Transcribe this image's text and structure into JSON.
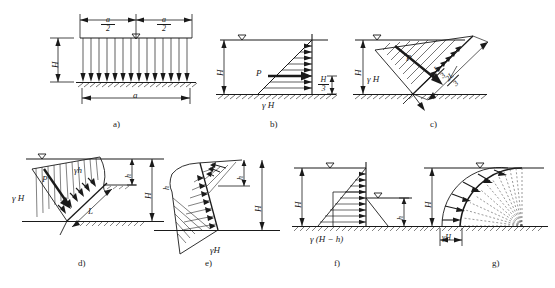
{
  "figure": {
    "kind": "engineering-diagram",
    "topic": "Hydrostatic pressure distribution diagrams on various surfaces",
    "symbols": {
      "gamma_H": "γH",
      "gamma_h": "γh",
      "gamma_H_minus_h": "γ(H − h)",
      "H": "H",
      "h": "h",
      "a": "a",
      "L": "L",
      "P": "P",
      "water_table": "▽"
    }
  },
  "panels": [
    {
      "id": "a",
      "caption": "a)",
      "labels": {
        "height": "H",
        "half_width_num": "a",
        "half_width_den": "2",
        "full_width": "a",
        "water_table": "▽"
      }
    },
    {
      "id": "b",
      "caption": "b)",
      "labels": {
        "height": "H",
        "resultant": "P",
        "base_pressure": "γ H",
        "centroid_num": "H",
        "centroid_den": "3",
        "water_table": "▽"
      }
    },
    {
      "id": "c",
      "caption": "c)",
      "labels": {
        "height": "H",
        "resultant": "P",
        "base_pressure": "γ H",
        "third_num": "L",
        "third_den": "3",
        "two_third_num": "2L",
        "two_third_den": "3",
        "water_table": "▽"
      }
    },
    {
      "id": "d",
      "caption": "d)",
      "labels": {
        "height": "H",
        "depth": "h",
        "resultant": "P",
        "base_pressure": "γ H",
        "upper_pressure": "γh",
        "length": "L",
        "water_table": "▽"
      }
    },
    {
      "id": "e",
      "caption": "e)",
      "labels": {
        "height": "H",
        "depth": "h",
        "depth2": "h",
        "base_pressure": "γH"
      }
    },
    {
      "id": "f",
      "caption": "f)",
      "labels": {
        "height": "H",
        "depth": "h",
        "base_pressure": "γ (H − h)",
        "water_table": "▽",
        "water_table2": "▽"
      }
    },
    {
      "id": "g",
      "caption": "g)",
      "labels": {
        "height": "H",
        "base_pressure": "γH",
        "water_table": "▽"
      }
    }
  ],
  "colors": {
    "ink": "#1a1a1a",
    "line": "#333333",
    "background": "#ffffff"
  }
}
